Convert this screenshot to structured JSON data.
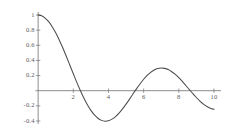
{
  "chart_data": {
    "type": "line",
    "title": "",
    "subtitle": "",
    "xlabel": "",
    "ylabel": "",
    "xlim": [
      -0.15,
      10.4
    ],
    "ylim": [
      -0.44,
      1.04
    ],
    "grid": false,
    "legend": null,
    "legend_position": "none",
    "axis_color": "#808080",
    "line_color": "#4d4d4d",
    "tick_label_color": "#5a5a5a",
    "background_color": "#ffffff",
    "x_ticks": [
      2,
      4,
      6,
      8,
      10
    ],
    "x_tick_labels": [
      "2",
      "4",
      "6",
      "8",
      "10"
    ],
    "y_ticks": [
      1,
      0.8,
      0.6,
      0.4,
      0.2,
      -0.2,
      -0.4
    ],
    "y_tick_labels": [
      "1",
      "0.8",
      "0.6",
      "0.4",
      "0.2",
      "-0.2",
      "-0.4"
    ],
    "annotations": [],
    "series": [
      {
        "name": "J0(x)",
        "x": [
          0,
          0.2,
          0.4,
          0.6,
          0.8,
          1.0,
          1.2,
          1.4,
          1.6,
          1.8,
          2.0,
          2.2,
          2.4,
          2.6,
          2.8,
          3.0,
          3.2,
          3.4,
          3.6,
          3.8,
          4.0,
          4.2,
          4.4,
          4.6,
          4.8,
          5.0,
          5.2,
          5.4,
          5.6,
          5.8,
          6.0,
          6.2,
          6.4,
          6.6,
          6.8,
          7.0,
          7.2,
          7.4,
          7.6,
          7.8,
          8.0,
          8.2,
          8.4,
          8.6,
          8.8,
          9.0,
          9.2,
          9.4,
          9.6,
          9.8,
          10.0
        ],
        "y": [
          1.0,
          0.99,
          0.96,
          0.912,
          0.846,
          0.765,
          0.671,
          0.567,
          0.455,
          0.34,
          0.224,
          0.11,
          0.003,
          -0.097,
          -0.185,
          -0.26,
          -0.32,
          -0.364,
          -0.392,
          -0.403,
          -0.397,
          -0.376,
          -0.342,
          -0.296,
          -0.24,
          -0.178,
          -0.111,
          -0.041,
          0.027,
          0.092,
          0.151,
          0.202,
          0.243,
          0.274,
          0.293,
          0.3,
          0.295,
          0.279,
          0.251,
          0.215,
          0.172,
          0.122,
          0.069,
          0.015,
          -0.039,
          -0.09,
          -0.137,
          -0.177,
          -0.209,
          -0.232,
          -0.246
        ]
      }
    ],
    "key_points": {
      "y_intercept": 1.0,
      "zeros": [
        2.405,
        5.52,
        8.654
      ],
      "minimum": {
        "x": 3.83,
        "y": -0.403
      },
      "maximum_secondary": {
        "x": 7.02,
        "y": 0.3
      },
      "end_value": {
        "x": 10.0,
        "y": -0.246
      }
    }
  }
}
